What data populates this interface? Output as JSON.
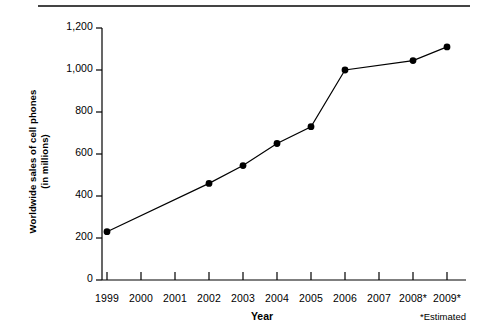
{
  "chart_data": {
    "type": "line",
    "title": "",
    "xlabel": "Year",
    "ylabel": "Worldwide sales of cell phones\n(in millions)",
    "categories": [
      "1999",
      "2000",
      "2001",
      "2002",
      "2003",
      "2004",
      "2005",
      "2006",
      "2007",
      "2008*",
      "2009*"
    ],
    "x_tick_labels": [
      "1999",
      "2000",
      "2001",
      "2002",
      "2003",
      "2004",
      "2005",
      "2006",
      "2007",
      "2008*",
      "2009*"
    ],
    "y_tick_labels": [
      "0",
      "200",
      "400",
      "600",
      "800",
      "1,000",
      "1,200"
    ],
    "y_ticks": [
      0,
      200,
      400,
      600,
      800,
      1000,
      1200
    ],
    "ylim": [
      0,
      1200
    ],
    "grid": false,
    "legend": null,
    "markers": "filled-circle",
    "series": [
      {
        "name": "Worldwide sales of cell phones (in millions)",
        "points": [
          {
            "x": "1999",
            "y": 230,
            "marker": true
          },
          {
            "x": "2002",
            "y": 460,
            "marker": true
          },
          {
            "x": "2003",
            "y": 545,
            "marker": true
          },
          {
            "x": "2004",
            "y": 650,
            "marker": true
          },
          {
            "x": "2005",
            "y": 730,
            "marker": true
          },
          {
            "x": "2006",
            "y": 1000,
            "marker": true
          },
          {
            "x": "2008*",
            "y": 1045,
            "marker": true
          },
          {
            "x": "2009*",
            "y": 1110,
            "marker": true
          }
        ]
      }
    ],
    "annotations": [
      "*Estimated"
    ],
    "footnote": "*Estimated",
    "colors": {
      "line": "#000000",
      "marker": "#000000",
      "axis": "#000000",
      "rule": "#444444",
      "background": "#ffffff"
    }
  }
}
